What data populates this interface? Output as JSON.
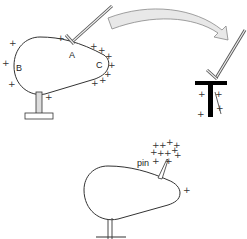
{
  "diagram": {
    "top_conductor": {
      "labels": {
        "a": "A",
        "b": "B",
        "c": "C"
      }
    },
    "transfer_arrow": {
      "fill": "#e6e6e6",
      "stroke": "#888888"
    },
    "bottom_conductor": {
      "pin_label": "pin"
    },
    "plus_sign": "+",
    "colors": {
      "line": "#333333",
      "stand_fill": "#dddddd",
      "t_bar": "#000000"
    }
  }
}
